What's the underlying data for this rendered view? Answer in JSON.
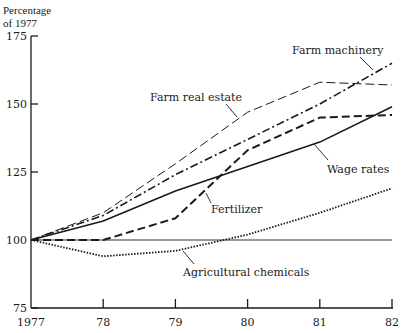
{
  "chart_data": {
    "type": "line",
    "title": "",
    "xlabel": "",
    "ylabel": "Percentage of 1977",
    "ylabel_lines": [
      "Percentage",
      "of 1977"
    ],
    "x": [
      "1977",
      "78",
      "79",
      "80",
      "81",
      "82"
    ],
    "yticks": [
      75,
      100,
      125,
      150,
      175
    ],
    "ylim": [
      75,
      175
    ],
    "grid": false,
    "baseline": 100,
    "legend_position": "inline labels",
    "series": [
      {
        "name": "Farm real estate",
        "style": "long-dash-thin",
        "values": [
          100,
          110,
          128,
          147,
          158,
          157
        ]
      },
      {
        "name": "Farm machinery",
        "style": "dash-dot",
        "values": [
          100,
          109,
          124,
          137,
          150,
          165
        ]
      },
      {
        "name": "Wage rates",
        "style": "solid",
        "values": [
          100,
          107,
          118,
          127,
          136,
          149
        ]
      },
      {
        "name": "Fertilizer",
        "style": "dashed-thick",
        "values": [
          100,
          100,
          108,
          133,
          145,
          146
        ]
      },
      {
        "name": "Agricultural chemicals",
        "style": "dotted",
        "values": [
          100,
          94,
          96,
          102,
          110,
          119
        ]
      }
    ],
    "annotations": [
      {
        "text": "Farm machinery",
        "series": "Farm machinery"
      },
      {
        "text": "Farm real estate",
        "series": "Farm real estate"
      },
      {
        "text": "Wage rates",
        "series": "Wage rates"
      },
      {
        "text": "Fertilizer",
        "series": "Fertilizer"
      },
      {
        "text": "Agricultural chemicals",
        "series": "Agricultural chemicals"
      }
    ]
  }
}
